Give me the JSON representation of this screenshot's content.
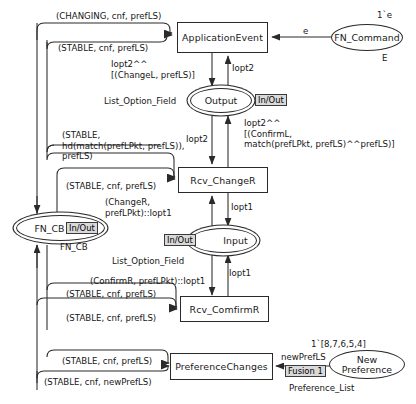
{
  "diagram": {
    "nodes": {
      "application_event": "ApplicationEvent",
      "fn_command": "FN_Command",
      "output": "Output",
      "rcv_changer": "Rcv_ChangeR",
      "fn_cb": "FN_CB",
      "input": "Input",
      "rcv_comfirmr": "Rcv_ComfirmR",
      "preference_changes": "PreferenceChanges",
      "new_preference": "New\nPreference"
    },
    "tags": {
      "output_inout": "In/Out",
      "fn_cb_inout": "In/Out",
      "input_inout": "In/Out",
      "fusion": "Fusion 1"
    },
    "colorsets": {
      "fn_command": "E",
      "output": "List_Option_Field",
      "fn_cb": "FN_CB",
      "input": "List_Option_Field",
      "new_preference": "Preference_List"
    },
    "markings": {
      "fn_command": "1`e",
      "new_preference": "1`[8,7,6,5,4]"
    },
    "arcs": {
      "changing_cnf_preflis": "(CHANGING, cnf, prefLS)",
      "stable_cnf_preflis_top": "(STABLE, cnf, prefLS)",
      "e": "e",
      "lopt2_changel": "Iopt2^^\n[(ChangeL, prefLS)]",
      "lopt2_a": "Iopt2",
      "lopt2_b": "Iopt2",
      "lopt2_confirml": "Iopt2^^\n[(ConfirmL,\nmatch(prefLPkt, prefLS)^^prefLS)]",
      "stable_hd_match": "(STABLE,\nhd(match(prefLPkt, prefLS)),\nprefLS)",
      "stable_cnf_preflis_changer": "(STABLE, cnf, prefLS)",
      "changer_preflpkt_lopt1": "(ChangeR,\nprefLPkt)::Iopt1",
      "lopt1_a": "Iopt1",
      "lopt1_b": "Iopt1",
      "fn_cb_label": "FN_CB",
      "confirmr_preflpkt_lopt1": "(ConfirmR, prefLPkt)::Iopt1",
      "stable_cnf_preflis_confirm_a": "(STABLE, cnf, prefLS)",
      "stable_cnf_preflis_confirm_b": "(STABLE, cnf, prefLS)",
      "stable_cnf_preflis_pref": "(STABLE, cnf, prefLS)",
      "stable_cnf_newpreflis": "(STABLE, cnf, newPrefLS)",
      "newpreflis": "newPrefLS"
    },
    "accent": "#2a2a2a",
    "tag_bg": "#d9d9d9"
  }
}
